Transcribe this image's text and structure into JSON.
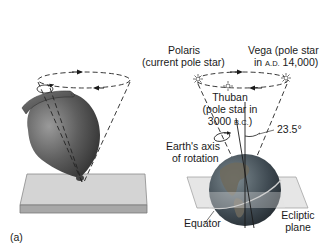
{
  "figure": {
    "panel_label": "(a)",
    "labels": {
      "polaris_line1": "Polaris",
      "polaris_line2": "(current pole star)",
      "vega_line1": "Vega (pole star",
      "vega_line2_prefix": "in ",
      "vega_line2_era": "A.D.",
      "vega_line2_suffix": " 14,000)",
      "thuban_line1": "Thuban",
      "thuban_line2": "(pole star in",
      "thuban_line3_prefix": "3000 ",
      "thuban_line3_era": "B.C.",
      "thuban_line3_suffix": ")",
      "tilt_angle": "23.5°",
      "axis_line1": "Earth's axis",
      "axis_line2": "of rotation",
      "equator": "Equator",
      "ecliptic_line1": "Ecliptic",
      "ecliptic_line2": "plane"
    },
    "stars": [
      "Polaris",
      "Vega",
      "Thuban"
    ],
    "colors": {
      "top_body": "#5a5a5a",
      "plate": "#d0d0d0",
      "globe_ocean": "#3e4a52",
      "globe_land": "#6f6a5c",
      "ecliptic_plane": "#dcdcdc",
      "text": "#1a1a1a"
    }
  }
}
